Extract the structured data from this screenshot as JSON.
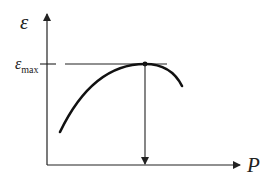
{
  "diagram": {
    "y_axis_label": "ε",
    "x_axis_label": "P",
    "max_label_main": "ε",
    "max_label_sub": "max",
    "colors": {
      "ink": "#222222",
      "background": "#ffffff"
    }
  }
}
